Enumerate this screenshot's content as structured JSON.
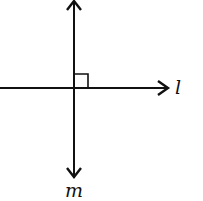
{
  "diagram": {
    "type": "perpendicular-lines",
    "lines": [
      {
        "name": "l",
        "orientation": "horizontal",
        "arrow": "right"
      },
      {
        "name": "m",
        "orientation": "vertical",
        "arrow": "both"
      }
    ],
    "right_angle_marker": true,
    "labels": {
      "line_l": "l",
      "line_m": "m"
    },
    "colors": {
      "stroke": "#111111",
      "background": "#ffffff"
    }
  }
}
